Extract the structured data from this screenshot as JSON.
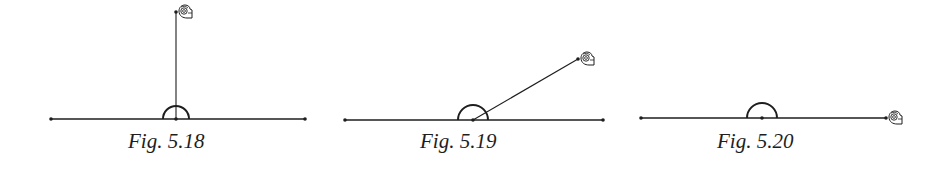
{
  "colors": {
    "ink": "#1e1e1e",
    "background": "#ffffff"
  },
  "figures": [
    {
      "caption": "Fig. 5.18",
      "caption_left": 128,
      "caption_top": 131,
      "baseline": {
        "x1": 51,
        "y1": 119,
        "x2": 305,
        "y2": 119
      },
      "vertex": {
        "x": 176,
        "y": 119
      },
      "arc_radius": 13,
      "arm": {
        "x2": 176,
        "y2": 12
      },
      "hand_icon": {
        "x": 178,
        "y": 5
      },
      "rotation": "quarter turn"
    },
    {
      "caption": "Fig. 5.19",
      "caption_left": 420,
      "caption_top": 131,
      "baseline": {
        "x1": 345,
        "y1": 120,
        "x2": 603,
        "y2": 120
      },
      "vertex": {
        "x": 473,
        "y": 120
      },
      "arc_radius": 15,
      "arm": {
        "x2": 578,
        "y2": 59
      },
      "hand_icon": {
        "x": 580,
        "y": 52
      },
      "rotation": "partial turn"
    },
    {
      "caption": "Fig. 5.20",
      "caption_left": 717,
      "caption_top": 131,
      "baseline": {
        "x1": 641,
        "y1": 118,
        "x2": 886,
        "y2": 118
      },
      "vertex": {
        "x": 762,
        "y": 118
      },
      "arc_radius": 15,
      "arm": {
        "x2": 886,
        "y2": 118
      },
      "hand_icon": {
        "x": 888,
        "y": 111
      },
      "rotation": "straight angle"
    }
  ]
}
